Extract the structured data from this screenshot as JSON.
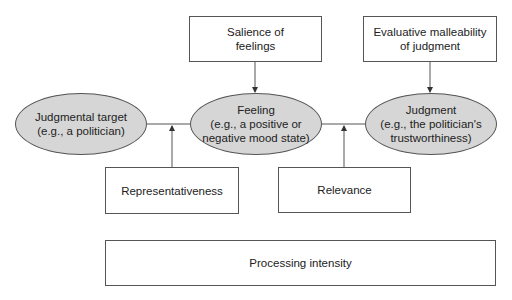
{
  "diagram": {
    "nodes": {
      "salience": {
        "label": "Salience of\nfeelings",
        "shape": "box"
      },
      "malleability": {
        "label": "Evaluative malleability\nof judgment",
        "shape": "box"
      },
      "target": {
        "label": "Judgmental target\n(e.g., a politician)",
        "shape": "ellipse"
      },
      "feeling": {
        "label": "Feeling\n(e.g., a positive or\nnegative mood state)",
        "shape": "ellipse"
      },
      "judgment": {
        "label": "Judgment\n(e.g., the politician's\ntrustworthiness)",
        "shape": "ellipse"
      },
      "representativeness": {
        "label": "Representativeness",
        "shape": "box"
      },
      "relevance": {
        "label": "Relevance",
        "shape": "box"
      },
      "processing": {
        "label": "Processing intensity",
        "shape": "box"
      }
    },
    "edges": [
      {
        "from": "target",
        "to": "feeling",
        "type": "line"
      },
      {
        "from": "feeling",
        "to": "judgment",
        "type": "line"
      },
      {
        "from": "salience",
        "to": "feeling",
        "type": "arrow"
      },
      {
        "from": "malleability",
        "to": "judgment",
        "type": "arrow"
      },
      {
        "from": "representativeness",
        "to": "target-feeling-link",
        "type": "arrow"
      },
      {
        "from": "relevance",
        "to": "feeling-judgment-link",
        "type": "arrow"
      }
    ],
    "colors": {
      "ellipse_fill": "#d6d6d6",
      "stroke": "#555555",
      "background": "#ffffff"
    }
  }
}
